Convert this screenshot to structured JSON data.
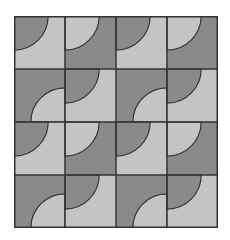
{
  "figure": {
    "type": "quarter-circle tile pattern",
    "rows": 4,
    "cols": 4,
    "colors": {
      "dark": "#8a8a8a",
      "light": "#c4c4c4",
      "line": "#333333",
      "background": "#ffffff"
    },
    "tile_types": {
      "A": {
        "background": "light",
        "arc_fill": "dark",
        "corner": "top-left"
      },
      "B": {
        "background": "dark",
        "arc_fill": "light",
        "corner": "top-left"
      },
      "C": {
        "background": "dark",
        "arc_fill": "light",
        "corner": "bottom-right"
      }
    },
    "layout": [
      [
        "A",
        "B",
        "A",
        "B"
      ],
      [
        "C",
        "A",
        "C",
        "A"
      ],
      [
        "A",
        "B",
        "A",
        "B"
      ],
      [
        "C",
        "A",
        "C",
        "A"
      ]
    ]
  }
}
